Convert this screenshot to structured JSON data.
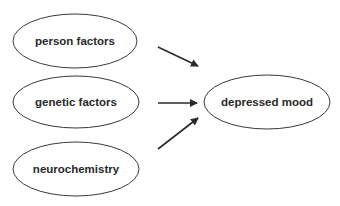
{
  "diagram": {
    "nodes": [
      {
        "id": "person",
        "label": "person factors"
      },
      {
        "id": "genetic",
        "label": "genetic factors"
      },
      {
        "id": "neuro",
        "label": "neurochemistry"
      },
      {
        "id": "mood",
        "label": "depressed mood"
      }
    ],
    "edges": [
      {
        "from": "person",
        "to": "mood"
      },
      {
        "from": "genetic",
        "to": "mood"
      },
      {
        "from": "neuro",
        "to": "mood"
      }
    ],
    "colors": {
      "stroke": "#3a3a3a",
      "text": "#2a2a2a",
      "background": "#ffffff"
    }
  }
}
